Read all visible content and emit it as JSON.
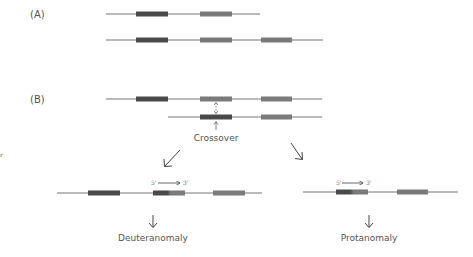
{
  "panels": {
    "a_label": "(A)",
    "b_label": "(B)"
  },
  "labels": {
    "crossover": "Crossover",
    "deuteranomaly": "Deuteranomaly",
    "protanomaly": "Protanomaly",
    "five_prime": "5'",
    "three_prime": "3'",
    "stray_mark": "r"
  },
  "colors": {
    "chromosome_line": "#777777",
    "gene_red_opsin": "#4a4a4a",
    "gene_green_opsin": "#7a7a7a",
    "text": "#555555",
    "arrow": "#444444"
  },
  "chromosomes": [
    {
      "id": "a1",
      "y": 14,
      "x1": 106,
      "x2": 260,
      "genes": [
        {
          "x": 136,
          "w": 32,
          "type": "red"
        },
        {
          "x": 200,
          "w": 32,
          "type": "green"
        }
      ]
    },
    {
      "id": "a2",
      "y": 40,
      "x1": 106,
      "x2": 323,
      "genes": [
        {
          "x": 136,
          "w": 32,
          "type": "red"
        },
        {
          "x": 200,
          "w": 32,
          "type": "green"
        },
        {
          "x": 261,
          "w": 31,
          "type": "green"
        }
      ]
    },
    {
      "id": "b1",
      "y": 99,
      "x1": 106,
      "x2": 322,
      "genes": [
        {
          "x": 136,
          "w": 32,
          "type": "red"
        },
        {
          "x": 200,
          "w": 32,
          "type": "green"
        },
        {
          "x": 261,
          "w": 31,
          "type": "green"
        }
      ]
    },
    {
      "id": "b2",
      "y": 117,
      "x1": 168,
      "x2": 322,
      "genes": [
        {
          "x": 200,
          "w": 32,
          "type": "red"
        },
        {
          "x": 261,
          "w": 31,
          "type": "green"
        }
      ]
    },
    {
      "id": "deuteranomaly",
      "y": 193,
      "x1": 57,
      "x2": 262,
      "genes": [
        {
          "x": 88,
          "w": 32,
          "type": "red"
        },
        {
          "x": 153,
          "w": 32,
          "type": "hybrid"
        },
        {
          "x": 213,
          "w": 32,
          "type": "green"
        }
      ]
    },
    {
      "id": "protanomaly",
      "y": 192,
      "x1": 303,
      "x2": 458,
      "genes": [
        {
          "x": 336,
          "w": 32,
          "type": "hybrid"
        },
        {
          "x": 397,
          "w": 31,
          "type": "green"
        }
      ]
    }
  ]
}
